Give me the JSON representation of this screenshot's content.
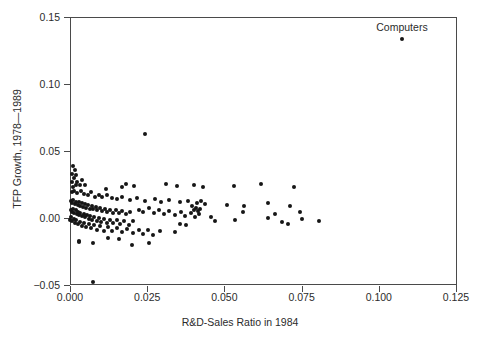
{
  "chart_data": {
    "type": "scatter",
    "title": "",
    "xlabel": "R&D-Sales Ratio in 1984",
    "ylabel": "TFP Growth, 1978—1989",
    "xlim": [
      0.0,
      0.125
    ],
    "ylim": [
      -0.05,
      0.15
    ],
    "grid": false,
    "legend": null,
    "xticks": [
      0.0,
      0.025,
      0.05,
      0.075,
      0.1,
      0.125
    ],
    "xticklabels": [
      "0.000",
      "0.025",
      "0.050",
      "0.075",
      "0.100",
      "0.125"
    ],
    "yticks": [
      -0.05,
      0.0,
      0.05,
      0.1,
      0.15
    ],
    "yticklabels": [
      "−0.05",
      "0.00",
      "0.05",
      "0.10",
      "0.15"
    ],
    "marker": "filled-circle",
    "marker_color": "#161616",
    "annotations": [
      {
        "text": "Computers",
        "x": 0.1075,
        "y": 0.1425,
        "point_x": 0.1075,
        "point_y": 0.1335
      }
    ],
    "series": [
      {
        "name": "Industries",
        "points": [
          [
            0.1075,
            0.1335
          ],
          [
            0.0242,
            0.063
          ],
          [
            0.0011,
            0.039
          ],
          [
            0.0016,
            0.036
          ],
          [
            0.0008,
            0.033
          ],
          [
            0.0021,
            0.0318
          ],
          [
            0.0013,
            0.0295
          ],
          [
            0.004,
            0.0283
          ],
          [
            0.0005,
            0.0268
          ],
          [
            0.0019,
            0.025
          ],
          [
            0.0033,
            0.0243
          ],
          [
            0.0009,
            0.0232
          ],
          [
            0.018,
            0.0252
          ],
          [
            0.0206,
            0.024
          ],
          [
            0.031,
            0.0255
          ],
          [
            0.0345,
            0.0237
          ],
          [
            0.04,
            0.0245
          ],
          [
            0.043,
            0.0228
          ],
          [
            0.053,
            0.0238
          ],
          [
            0.062,
            0.0252
          ],
          [
            0.0725,
            0.0235
          ],
          [
            0.0005,
            0.0195
          ],
          [
            0.0014,
            0.0205
          ],
          [
            0.0024,
            0.0188
          ],
          [
            0.0036,
            0.0198
          ],
          [
            0.0045,
            0.0182
          ],
          [
            0.0058,
            0.0175
          ],
          [
            0.0067,
            0.0192
          ],
          [
            0.008,
            0.016
          ],
          [
            0.0094,
            0.0172
          ],
          [
            0.0104,
            0.0155
          ],
          [
            0.012,
            0.0168
          ],
          [
            0.0137,
            0.0152
          ],
          [
            0.0152,
            0.0145
          ],
          [
            0.0168,
            0.016
          ],
          [
            0.0195,
            0.0138
          ],
          [
            0.0218,
            0.015
          ],
          [
            0.0243,
            0.0128
          ],
          [
            0.0275,
            0.0142
          ],
          [
            0.0295,
            0.012
          ],
          [
            0.032,
            0.0135
          ],
          [
            0.0355,
            0.0118
          ],
          [
            0.0382,
            0.0128
          ],
          [
            0.041,
            0.0112
          ],
          [
            0.0425,
            0.0125
          ],
          [
            0.0438,
            0.0105
          ],
          [
            0.0508,
            0.0098
          ],
          [
            0.0565,
            0.0092
          ],
          [
            0.064,
            0.0112
          ],
          [
            0.0712,
            0.0088
          ],
          [
            0.0003,
            0.0128
          ],
          [
            0.0007,
            0.0115
          ],
          [
            0.0011,
            0.0135
          ],
          [
            0.0016,
            0.0108
          ],
          [
            0.002,
            0.0122
          ],
          [
            0.0025,
            0.0098
          ],
          [
            0.0029,
            0.0118
          ],
          [
            0.0034,
            0.0092
          ],
          [
            0.0038,
            0.011
          ],
          [
            0.0043,
            0.0085
          ],
          [
            0.0048,
            0.0102
          ],
          [
            0.0053,
            0.0078
          ],
          [
            0.0058,
            0.0095
          ],
          [
            0.0064,
            0.007
          ],
          [
            0.007,
            0.0088
          ],
          [
            0.0076,
            0.0064
          ],
          [
            0.0083,
            0.0082
          ],
          [
            0.0089,
            0.0058
          ],
          [
            0.0096,
            0.0075
          ],
          [
            0.0103,
            0.0052
          ],
          [
            0.0112,
            0.0068
          ],
          [
            0.012,
            0.0046
          ],
          [
            0.0128,
            0.0062
          ],
          [
            0.0138,
            0.004
          ],
          [
            0.0148,
            0.0056
          ],
          [
            0.0158,
            0.0034
          ],
          [
            0.017,
            0.005
          ],
          [
            0.0182,
            0.0028
          ],
          [
            0.0194,
            0.0044
          ],
          [
            0.0002,
            0.0062
          ],
          [
            0.0006,
            0.0048
          ],
          [
            0.001,
            0.007
          ],
          [
            0.0014,
            0.0038
          ],
          [
            0.0018,
            0.0056
          ],
          [
            0.0022,
            0.0028
          ],
          [
            0.0026,
            0.0048
          ],
          [
            0.003,
            0.002
          ],
          [
            0.0034,
            0.004
          ],
          [
            0.0039,
            0.0012
          ],
          [
            0.0044,
            0.0032
          ],
          [
            0.0049,
            0.0004
          ],
          [
            0.0054,
            0.0025
          ],
          [
            0.006,
            -0.0004
          ],
          [
            0.0066,
            0.0018
          ],
          [
            0.0072,
            -0.0012
          ],
          [
            0.0079,
            0.001
          ],
          [
            0.0086,
            -0.002
          ],
          [
            0.0093,
            0.0002
          ],
          [
            0.0101,
            -0.0028
          ],
          [
            0.011,
            -0.0006
          ],
          [
            0.0119,
            -0.0034
          ],
          [
            0.0129,
            -0.0014
          ],
          [
            0.014,
            -0.004
          ],
          [
            0.0151,
            -0.0018
          ],
          [
            0.0163,
            -0.0046
          ],
          [
            0.0176,
            -0.0022
          ],
          [
            0.019,
            -0.005
          ],
          [
            0.0205,
            -0.0026
          ],
          [
            0.0001,
            -0.0014
          ],
          [
            0.0004,
            0.0004
          ],
          [
            0.0008,
            -0.0026
          ],
          [
            0.0012,
            -0.0006
          ],
          [
            0.0017,
            -0.0038
          ],
          [
            0.0021,
            -0.0016
          ],
          [
            0.0027,
            -0.0048
          ],
          [
            0.0032,
            -0.0028
          ],
          [
            0.0038,
            -0.0058
          ],
          [
            0.0045,
            -0.0036
          ],
          [
            0.0052,
            -0.0068
          ],
          [
            0.006,
            -0.0044
          ],
          [
            0.0068,
            -0.0078
          ],
          [
            0.0077,
            -0.0054
          ],
          [
            0.0088,
            -0.0086
          ],
          [
            0.0098,
            -0.0062
          ],
          [
            0.011,
            -0.0094
          ],
          [
            0.0123,
            -0.007
          ],
          [
            0.0137,
            -0.01
          ],
          [
            0.0152,
            -0.0076
          ],
          [
            0.0168,
            -0.0108
          ],
          [
            0.0186,
            -0.0082
          ],
          [
            0.0205,
            -0.0114
          ],
          [
            0.0225,
            -0.0086
          ],
          [
            0.0235,
            -0.012
          ],
          [
            0.0252,
            -0.009
          ],
          [
            0.0268,
            -0.0124
          ],
          [
            0.0292,
            -0.0096
          ],
          [
            0.0222,
            0.0062
          ],
          [
            0.0238,
            0.0048
          ],
          [
            0.0255,
            0.0072
          ],
          [
            0.0272,
            0.004
          ],
          [
            0.0288,
            0.006
          ],
          [
            0.0305,
            0.0032
          ],
          [
            0.0322,
            0.0052
          ],
          [
            0.034,
            0.0022
          ],
          [
            0.0358,
            0.0044
          ],
          [
            0.0374,
            0.0014
          ],
          [
            0.0392,
            0.0038
          ],
          [
            0.0406,
            0.0006
          ],
          [
            0.0418,
            0.003
          ],
          [
            0.0396,
            0.009
          ],
          [
            0.0408,
            0.0078
          ],
          [
            0.042,
            0.0066
          ],
          [
            0.0402,
            0.0058
          ],
          [
            0.0414,
            0.005
          ],
          [
            0.0355,
            -0.0046
          ],
          [
            0.0375,
            -0.005
          ],
          [
            0.0455,
            0.0004
          ],
          [
            0.047,
            -0.0024
          ],
          [
            0.0535,
            -0.0012
          ],
          [
            0.056,
            0.0048
          ],
          [
            0.064,
            0.0
          ],
          [
            0.0665,
            0.0028
          ],
          [
            0.0688,
            -0.0028
          ],
          [
            0.0705,
            -0.0048
          ],
          [
            0.0745,
            0.0046
          ],
          [
            0.0752,
            -0.001
          ],
          [
            0.0805,
            -0.0024
          ],
          [
            0.0118,
            0.0218
          ],
          [
            0.0168,
            0.0228
          ],
          [
            0.0048,
            0.0248
          ],
          [
            0.0022,
            0.0272
          ],
          [
            0.0075,
            -0.019
          ],
          [
            0.003,
            -0.017
          ],
          [
            0.0028,
            -0.0182
          ],
          [
            0.02,
            -0.02
          ],
          [
            0.0075,
            -0.0477
          ],
          [
            0.0255,
            -0.0185
          ],
          [
            0.034,
            -0.0108
          ],
          [
            0.0124,
            -0.0146
          ],
          [
            0.0158,
            -0.0158
          ]
        ]
      }
    ]
  }
}
